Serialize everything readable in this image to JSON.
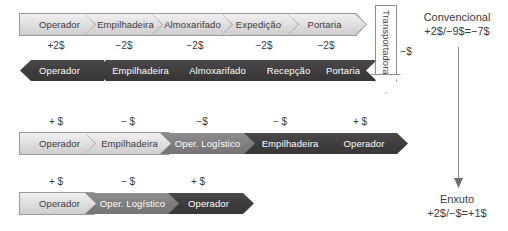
{
  "diagram": {
    "rows": [
      {
        "id": "row-conventional-outbound",
        "direction": "right",
        "steps": [
          {
            "label": "Operador",
            "cost": "+2$",
            "fill": "light"
          },
          {
            "label": "Empilhadeira",
            "cost": "−2$",
            "fill": "light"
          },
          {
            "label": "Almoxarifado",
            "cost": "−2$",
            "fill": "light"
          },
          {
            "label": "Expedição",
            "cost": "−2$",
            "fill": "light"
          },
          {
            "label": "Portaria",
            "cost": "−2$",
            "fill": "light"
          }
        ]
      },
      {
        "id": "row-conventional-inbound",
        "direction": "left",
        "steps": [
          {
            "label": "Operador",
            "fill": "dark"
          },
          {
            "label": "Empilhadeira",
            "fill": "dark"
          },
          {
            "label": "Almoxarifado",
            "fill": "dark"
          },
          {
            "label": "Recepção",
            "fill": "dark"
          },
          {
            "label": "Portaria",
            "fill": "dark"
          }
        ]
      },
      {
        "id": "row-lean-five",
        "direction": "right",
        "steps": [
          {
            "label": "Operador",
            "cost": "+ $",
            "fill": "light"
          },
          {
            "label": "Empilhadeira",
            "cost": "− $",
            "fill": "light"
          },
          {
            "label": "Oper. Logístico",
            "cost": "−$",
            "fill": "mid"
          },
          {
            "label": "Empilhadeira",
            "cost": "− $",
            "fill": "dark"
          },
          {
            "label": "Operador",
            "cost": "+ $",
            "fill": "dark"
          }
        ]
      },
      {
        "id": "row-lean-three",
        "direction": "right",
        "steps": [
          {
            "label": "Operador",
            "cost": "+ $",
            "fill": "light"
          },
          {
            "label": "Oper. Logístico",
            "cost": "− $",
            "fill": "mid"
          },
          {
            "label": "Operador",
            "cost": "+ $",
            "fill": "dark"
          }
        ]
      }
    ],
    "transportadora": {
      "label": "Transportadora",
      "cost": "−$"
    },
    "summaries": [
      {
        "id": "summary-conventional",
        "title": "Convencional",
        "equation": "+2$/−9$=−7$"
      },
      {
        "id": "summary-lean",
        "title": "Enxuto",
        "equation": "+2$/−$=+1$"
      }
    ],
    "colors": {
      "light": "#dddbdb",
      "mid": "#7e7c7c",
      "dark": "#3e3c3c",
      "text_dark": "#3b3b3b",
      "text_light": "#ffffff",
      "outline": "#8d8b8b",
      "background": "#ffffff"
    }
  }
}
